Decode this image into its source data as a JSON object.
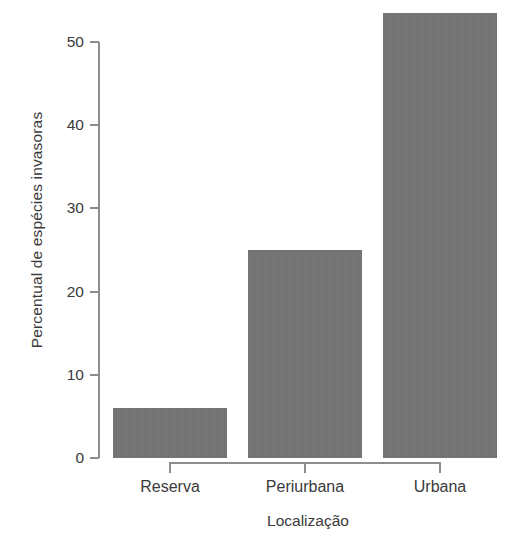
{
  "chart_data": {
    "type": "bar",
    "title": "",
    "subtitle": "",
    "categories": [
      "Reserva",
      "Periurbana",
      "Urbana"
    ],
    "values": [
      6,
      25,
      53.5
    ],
    "xlabel": "Localização",
    "ylabel": "Percentual de espécies invasoras",
    "ylim": [
      0,
      54
    ],
    "yticks": [
      0,
      10,
      20,
      30,
      40,
      50
    ],
    "ytick_labels": [
      "0",
      "10",
      "20",
      "30",
      "40",
      "50"
    ],
    "grid": false,
    "legend": null,
    "annotations": [],
    "colors": {
      "bar_fill": "#6e6e6e",
      "axis_line": "#8d8d8d",
      "text": "#3a3a3a",
      "background": "#ffffff"
    }
  }
}
